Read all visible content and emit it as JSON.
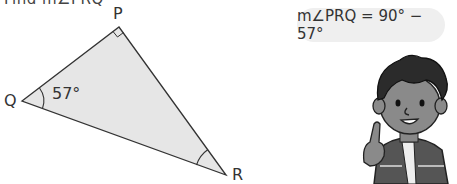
{
  "problem": {
    "title_partial": "Find m∠PRQ"
  },
  "triangle": {
    "vertices": {
      "P": "P",
      "Q": "Q",
      "R": "R"
    },
    "angle_Q_label": "57°",
    "right_angle_at": "P",
    "fill_color": "#e6e6e6",
    "stroke_color": "#333333"
  },
  "speech_bubble": {
    "text": "m∠PRQ = 90° − 57°"
  },
  "character": {
    "name": "boy-character",
    "gesture": "index finger raised"
  }
}
